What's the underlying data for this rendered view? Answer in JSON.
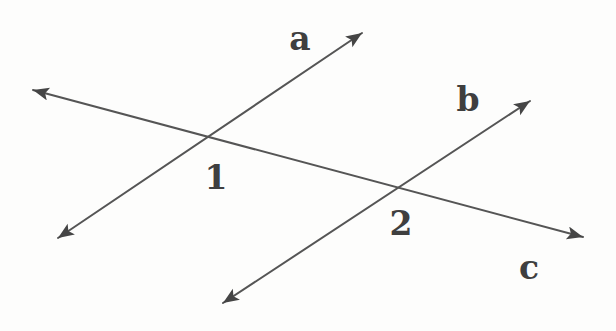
{
  "diagram": {
    "background_color": "#fdfdfc",
    "line_color": "#555555",
    "arrow_color": "#454545",
    "label_color": "#3f3f3f",
    "lines": [
      {
        "name": "a",
        "x1": 58,
        "y1": 238,
        "x2": 362,
        "y2": 33,
        "arrows": "both"
      },
      {
        "name": "b",
        "x1": 223,
        "y1": 303,
        "x2": 530,
        "y2": 101,
        "arrows": "both"
      },
      {
        "name": "c",
        "x1": 33,
        "y1": 90,
        "x2": 583,
        "y2": 237,
        "arrows": "both"
      }
    ],
    "line_labels": [
      {
        "text": "a",
        "x": 300,
        "y": 50
      },
      {
        "text": "b",
        "x": 468,
        "y": 111
      },
      {
        "text": "c",
        "x": 529,
        "y": 279
      }
    ],
    "point_labels": [
      {
        "text": "1",
        "x": 216,
        "y": 189,
        "meaning": "intersection of lines a and c"
      },
      {
        "text": "2",
        "x": 401,
        "y": 235,
        "meaning": "intersection of lines b and c"
      }
    ]
  }
}
